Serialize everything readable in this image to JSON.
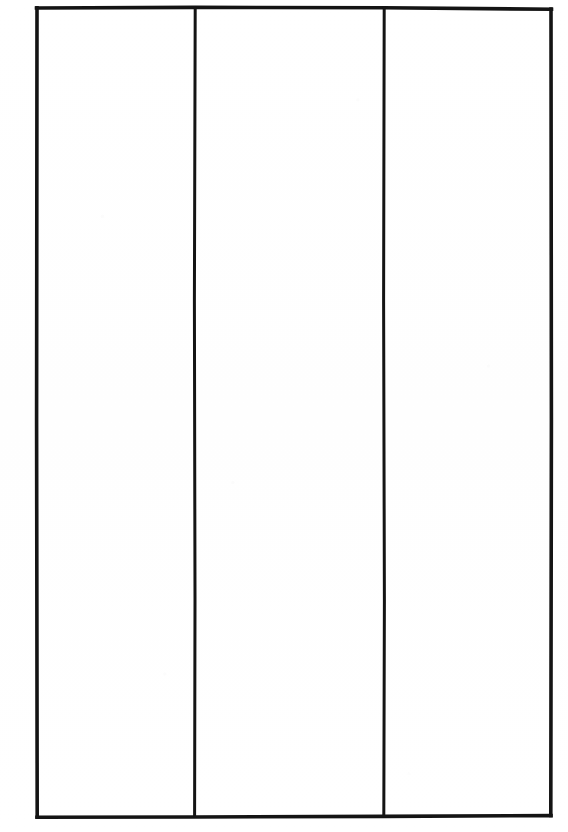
{
  "document": {
    "kind": "blank-three-column-table",
    "description": "Scanned blank form: a single empty table outline divided into three vertical columns by two full-height rules. No headers, no row lines, no text anywhere on the page.",
    "page_background_color": "#ffffff",
    "ink_color": "#141414"
  },
  "table": {
    "column_count": 3,
    "row_count": 0,
    "has_header_row": false,
    "is_empty": true,
    "frame": {
      "left": 36,
      "top": 7,
      "right": 552,
      "bottom": 817,
      "width": 516,
      "height": 810,
      "outer_stroke_width": 3.6
    },
    "dividers": [
      {
        "name": "divider-1",
        "x": 195,
        "stroke_width": 3.0
      },
      {
        "name": "divider-2",
        "x": 384,
        "stroke_width": 3.0
      }
    ],
    "columns": [
      {
        "index": 1,
        "name": "column-1",
        "label": "",
        "content": "",
        "left": 36,
        "right": 195,
        "width": 159
      },
      {
        "index": 2,
        "name": "column-2",
        "label": "",
        "content": "",
        "left": 195,
        "right": 384,
        "width": 189
      },
      {
        "index": 3,
        "name": "column-3",
        "label": "",
        "content": "",
        "left": 384,
        "right": 552,
        "width": 168
      }
    ]
  },
  "geometry": {
    "note": "Corner coordinates read off the scan; the frame is very slightly skewed, the top edge sitting ~2px lower on the right and the bottom edge ~2px higher on the right.",
    "corners": {
      "top_left": {
        "x": 36,
        "y": 7
      },
      "top_right": {
        "x": 552,
        "y": 9
      },
      "bottom_right": {
        "x": 552,
        "y": 815
      },
      "bottom_left": {
        "x": 36,
        "y": 817
      }
    }
  },
  "canvas": {
    "width": 568,
    "height": 832
  }
}
